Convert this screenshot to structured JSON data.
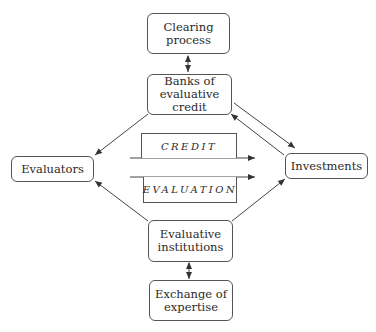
{
  "nodes": {
    "clearing": {
      "label": "Clearing\nprocess"
    },
    "banks": {
      "label": "Banks of\nevaluative credit"
    },
    "evaluators": {
      "label": "Evaluators"
    },
    "investments": {
      "label": "Investments"
    },
    "institutions": {
      "label": "Evaluative\ninstitutions"
    },
    "exchange": {
      "label": "Exchange of\nexpertise"
    }
  },
  "flows": {
    "credit": {
      "label": "CREDIT"
    },
    "evaluation": {
      "label": "EVALUATION"
    }
  },
  "colors": {
    "line": "#444444",
    "border": "#555555",
    "text": "#2a2a2a"
  }
}
